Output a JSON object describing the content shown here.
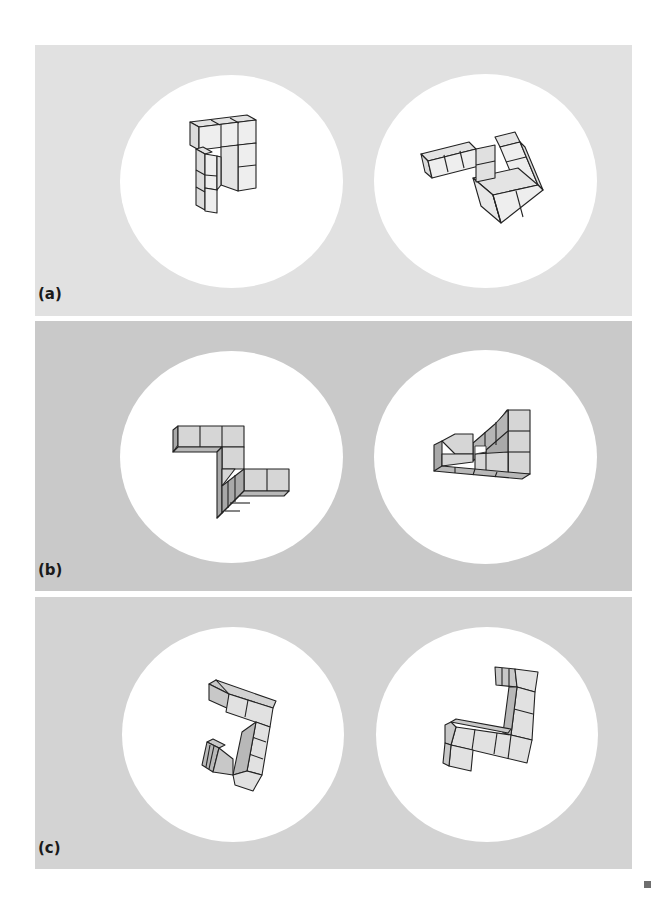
{
  "figure": {
    "panels": [
      {
        "id": "a",
        "label": "(a)",
        "background": "#e1e1e1",
        "cube_front": "#ededed",
        "cube_side": "#dcdcdc"
      },
      {
        "id": "b",
        "label": "(b)",
        "background": "#c9c9c9",
        "cube_front": "#d6d6d6",
        "cube_side": "#a9a9a9"
      },
      {
        "id": "c",
        "label": "(c)",
        "background": "#d3d3d3",
        "cube_front": "#e1e1e1",
        "cube_side": "#b8b8b8"
      }
    ],
    "end_mark": "square"
  }
}
